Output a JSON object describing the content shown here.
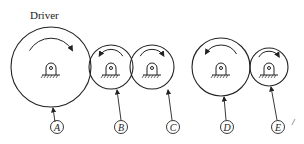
{
  "diagram": {
    "title": "Driver",
    "stroke_color": "#222222",
    "gears": [
      {
        "id": "A",
        "label": "A",
        "cx": 51,
        "cy": 67,
        "r": 40,
        "rotation": "clockwise",
        "leader": {
          "x1": 53,
          "y1": 107,
          "x2": 55,
          "y2": 122
        },
        "label_pos": {
          "x": 57,
          "y": 127
        }
      },
      {
        "id": "B",
        "label": "B",
        "cx": 111,
        "cy": 67,
        "r": 22,
        "rotation": "counterclockwise",
        "leader": {
          "x1": 117,
          "y1": 89,
          "x2": 121,
          "y2": 120
        },
        "label_pos": {
          "x": 121,
          "y": 127
        }
      },
      {
        "id": "C",
        "label": "C",
        "cx": 152,
        "cy": 67,
        "r": 22,
        "rotation": "clockwise",
        "leader": {
          "x1": 168,
          "y1": 89,
          "x2": 172,
          "y2": 120
        },
        "label_pos": {
          "x": 173,
          "y": 127
        }
      },
      {
        "id": "D",
        "label": "D",
        "cx": 221,
        "cy": 67,
        "r": 29,
        "rotation": "counterclockwise",
        "leader": {
          "x1": 224,
          "y1": 96,
          "x2": 226,
          "y2": 120
        },
        "label_pos": {
          "x": 227,
          "y": 127
        }
      },
      {
        "id": "E",
        "label": "E",
        "cx": 269,
        "cy": 67,
        "r": 19,
        "rotation": "clockwise",
        "leader": {
          "x1": 271,
          "y1": 86,
          "x2": 277,
          "y2": 120
        },
        "label_pos": {
          "x": 278,
          "y": 127
        }
      }
    ]
  }
}
